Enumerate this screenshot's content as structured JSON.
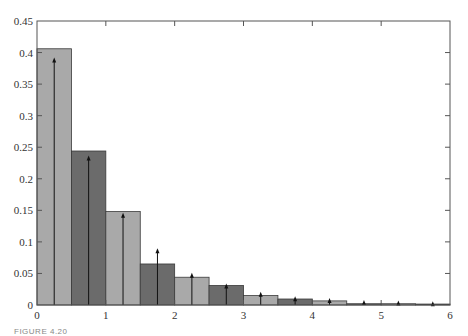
{
  "caption": "FIGURE 4.20",
  "chart_data": {
    "type": "bar",
    "title": "",
    "xlabel": "",
    "ylabel": "",
    "xlim": [
      0,
      6
    ],
    "ylim": [
      0,
      0.45
    ],
    "grid": false,
    "legend": null,
    "x_ticks": [
      "0",
      "1",
      "2",
      "3",
      "4",
      "5",
      "6"
    ],
    "y_ticks": [
      "0",
      "0.05",
      "0.1",
      "0.15",
      "0.2",
      "0.25",
      "0.3",
      "0.35",
      "0.4",
      "0.45"
    ],
    "bar_width": 0.5,
    "bin_edges": [
      0,
      0.5,
      1.0,
      1.5,
      2.0,
      2.5,
      3.0,
      3.5,
      4.0,
      4.5,
      5.0,
      5.5,
      6.0
    ],
    "series": [
      {
        "name": "histogram",
        "type": "bar",
        "x": [
          0.25,
          0.75,
          1.25,
          1.75,
          2.25,
          2.75,
          3.25,
          3.75,
          4.25,
          4.75,
          5.25,
          5.75
        ],
        "values": [
          0.406,
          0.244,
          0.148,
          0.065,
          0.044,
          0.031,
          0.015,
          0.0095,
          0.0065,
          0.002,
          0.002,
          0.0015
        ],
        "colors": [
          "#a9a9a9",
          "#6b6b6b",
          "#a9a9a9",
          "#6b6b6b",
          "#a9a9a9",
          "#6b6b6b",
          "#a9a9a9",
          "#6b6b6b",
          "#a9a9a9",
          "#6b6b6b",
          "#a9a9a9",
          "#6b6b6b"
        ]
      },
      {
        "name": "impulses",
        "type": "stem-arrow",
        "x": [
          0.25,
          0.75,
          1.25,
          1.75,
          2.25,
          2.75,
          3.25,
          3.75,
          4.25,
          4.75,
          5.25,
          5.75
        ],
        "values": [
          0.392,
          0.237,
          0.146,
          0.09,
          0.051,
          0.034,
          0.021,
          0.014,
          0.011,
          0.008,
          0.007,
          0.006
        ],
        "color": "#111111"
      }
    ],
    "colors": {
      "light_bar": "#a9a9a9",
      "dark_bar": "#6b6b6b",
      "axis": "#555555",
      "arrow": "#111111"
    }
  }
}
